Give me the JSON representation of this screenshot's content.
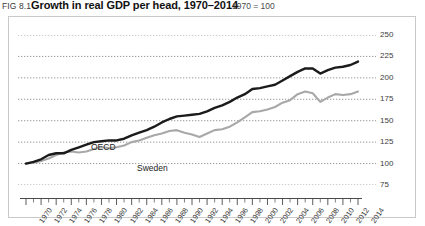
{
  "title": {
    "fig_number": "FIG 8.1",
    "text": "Growth in real GDP per head, 1970–2014",
    "units": "1970 = 100"
  },
  "colors": {
    "oecd": "#1b1b1b",
    "sweden": "#a8a8a8",
    "gridline": "#8c8c8c",
    "panel_border": "#c9c9c9",
    "axis": "#4a4a4a",
    "text": "#3d3d3d"
  },
  "labels": {
    "oecd": "OECD",
    "sweden": "Sweden"
  },
  "chart_data": {
    "type": "line",
    "title": "Growth in real GDP per head, 1970–2014",
    "subtitle": "1970 = 100",
    "xlabel": "",
    "ylabel": "",
    "ylim": [
      75,
      250
    ],
    "yticks": [
      75,
      100,
      125,
      150,
      175,
      200,
      225,
      250
    ],
    "xlim": [
      1970,
      2014
    ],
    "xticks": [
      1970,
      1972,
      1974,
      1976,
      1978,
      1980,
      1982,
      1984,
      1986,
      1988,
      1990,
      1992,
      1994,
      1996,
      1998,
      2000,
      2002,
      2004,
      2006,
      2008,
      2010,
      2012,
      2014
    ],
    "minor_xticks_every": 1,
    "grid": "horizontal-dotted",
    "legend": "inline-labels",
    "x": [
      1970,
      1971,
      1972,
      1973,
      1974,
      1975,
      1976,
      1977,
      1978,
      1979,
      1980,
      1981,
      1982,
      1983,
      1984,
      1985,
      1986,
      1987,
      1988,
      1989,
      1990,
      1991,
      1992,
      1993,
      1994,
      1995,
      1996,
      1997,
      1998,
      1999,
      2000,
      2001,
      2002,
      2003,
      2004,
      2005,
      2006,
      2007,
      2008,
      2009,
      2010,
      2011,
      2012,
      2013,
      2014
    ],
    "series": [
      {
        "name": "OECD",
        "color": "#1b1b1b",
        "values": [
          100,
          102,
          105,
          110,
          112,
          112,
          116,
          119,
          122,
          125,
          126,
          127,
          127,
          129,
          133,
          136,
          139,
          143,
          148,
          152,
          155,
          156,
          157,
          158,
          161,
          165,
          168,
          172,
          177,
          181,
          187,
          188,
          190,
          192,
          197,
          202,
          207,
          211,
          211,
          205,
          209,
          212,
          213,
          215,
          219
        ]
      },
      {
        "name": "Sweden",
        "color": "#a8a8a8",
        "values": [
          100,
          101,
          103,
          106,
          110,
          113,
          114,
          113,
          114,
          117,
          119,
          118,
          119,
          121,
          125,
          127,
          130,
          133,
          135,
          138,
          139,
          136,
          134,
          131,
          135,
          139,
          140,
          143,
          148,
          154,
          160,
          161,
          163,
          166,
          171,
          174,
          181,
          184,
          182,
          172,
          177,
          181,
          180,
          181,
          184
        ]
      }
    ],
    "note_points": {
      "oecd_end_value": 219,
      "sweden_end_value": 184,
      "sweden_trough_year": 1993,
      "crisis_dip_year": 2009
    }
  },
  "ytick_labels": [
    "250",
    "225",
    "200",
    "175",
    "150",
    "125",
    "100",
    "75"
  ],
  "xtick_labels": [
    "1970",
    "1972",
    "1974",
    "1976",
    "1978",
    "1980",
    "1982",
    "1984",
    "1986",
    "1988",
    "1990",
    "1992",
    "1994",
    "1996",
    "1998",
    "2000",
    "2002",
    "2004",
    "2006",
    "2008",
    "2010",
    "2012",
    "2014"
  ]
}
